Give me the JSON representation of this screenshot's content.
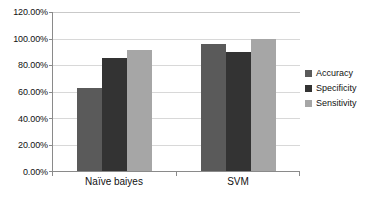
{
  "chart_data": {
    "type": "bar",
    "title": "",
    "subtitle": "",
    "xlabel": "",
    "ylabel": "",
    "categories": [
      "Naïve baiyes",
      "SVM"
    ],
    "series": [
      {
        "name": "Accuracy",
        "values": [
          63.0,
          96.0
        ],
        "color": "#5a5a5a"
      },
      {
        "name": "Specificity",
        "values": [
          85.0,
          90.0
        ],
        "color": "#333333"
      },
      {
        "name": "Sensitivity",
        "values": [
          91.0,
          100.0
        ],
        "color": "#a6a6a6"
      }
    ],
    "ylim": [
      0,
      120
    ],
    "y_ticks": [
      0,
      20,
      40,
      60,
      80,
      100,
      120
    ],
    "y_tick_labels": [
      "0.00%",
      "20.00%",
      "40.00%",
      "60.00%",
      "80.00%",
      "100.00%",
      "120.00%"
    ],
    "grid": true,
    "grid_axis": "y",
    "legend_position": "right",
    "value_format": "percent",
    "background_color": "#ffffff",
    "axis_color": "#8a8a8a",
    "gridline_color": "#d8d8d8"
  },
  "legend": {
    "items": [
      {
        "label": "Accuracy",
        "color": "#5a5a5a"
      },
      {
        "label": "Specificity",
        "color": "#333333"
      },
      {
        "label": "Sensitivity",
        "color": "#a6a6a6"
      }
    ]
  },
  "axes": {
    "y_tick_labels": [
      "120.00%",
      "100.00%",
      "80.00%",
      "60.00%",
      "40.00%",
      "20.00%",
      "0.00%"
    ],
    "x_tick_labels": [
      "Naïve baiyes",
      "SVM"
    ]
  }
}
